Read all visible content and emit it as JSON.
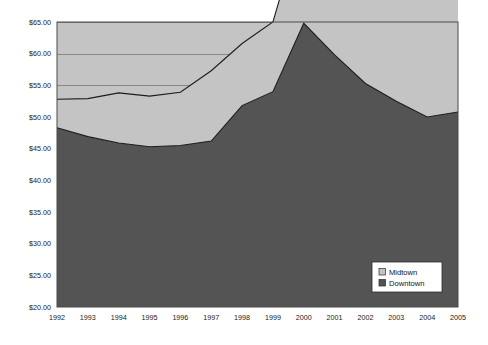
{
  "chart_data": {
    "type": "area",
    "stacked": true,
    "title": "",
    "subtitle": "",
    "xlabel": "",
    "ylabel": "",
    "categories": [
      "1992",
      "1993",
      "1994",
      "1995",
      "1996",
      "1997",
      "1998",
      "1999",
      "2000",
      "2001",
      "2002",
      "2003",
      "2004",
      "2005"
    ],
    "x": [
      1992,
      1993,
      1994,
      1995,
      1996,
      1997,
      1998,
      1999,
      2000,
      2001,
      2002,
      2003,
      2004,
      2005
    ],
    "series": [
      {
        "name": "Midtown",
        "color": "#c4c4c4",
        "values": [
          4.5,
          6.0,
          7.9,
          8.0,
          8.4,
          11.1,
          9.8,
          11.0,
          16.9,
          16.9,
          17.6,
          18.7,
          19.7,
          21.2
        ]
      },
      {
        "name": "Downtown",
        "color": "#545454",
        "values": [
          28.3,
          26.9,
          25.9,
          25.3,
          25.5,
          26.2,
          31.8,
          34.0,
          44.8,
          39.8,
          35.3,
          32.5,
          30.0,
          30.8
        ]
      }
    ],
    "totals": [
      32.8,
      32.9,
      33.8,
      33.3,
      33.9,
      37.3,
      41.6,
      45.0,
      61.7,
      56.7,
      52.9,
      51.2,
      49.7,
      52.0
    ],
    "ylim": [
      20,
      65
    ],
    "ytick_values": [
      20,
      25,
      30,
      35,
      40,
      45,
      50,
      55,
      60,
      65
    ],
    "ytick_labels": [
      "$20.00",
      "$25.00",
      "$30.00",
      "$35.00",
      "$40.00",
      "$45.00",
      "$50.00",
      "$55.00",
      "$60.00",
      "$65.00"
    ],
    "grid": true,
    "grid_axis": "y",
    "legend_position": "inside-bottom-right",
    "legend_entries": [
      "Midtown",
      "Downtown"
    ],
    "plot_background": "#c4c4c4",
    "figure_background": "#ffffff",
    "axis_color": "#4a4a4a"
  },
  "axes": {
    "y_labels": [
      "$65.00",
      "$60.00",
      "$55.00",
      "$50.00",
      "$45.00",
      "$40.00",
      "$35.00",
      "$30.00",
      "$25.00",
      "$20.00"
    ],
    "x_labels": [
      "1992",
      "1993",
      "1994",
      "1995",
      "1996",
      "1997",
      "1998",
      "1999",
      "2000",
      "2001",
      "2002",
      "2003",
      "2004",
      "2005"
    ]
  },
  "legend": {
    "items": [
      {
        "label": "Midtown",
        "color": "#c4c4c4"
      },
      {
        "label": "Downtown",
        "color": "#545454"
      }
    ]
  }
}
